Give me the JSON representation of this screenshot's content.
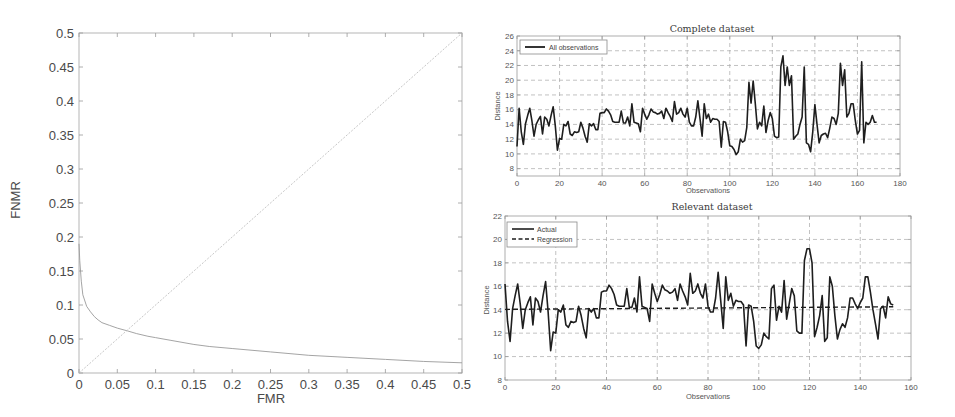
{
  "chart_data": [
    {
      "type": "line",
      "title": "",
      "xlabel": "FMR",
      "ylabel": "FNMR",
      "xlim": [
        0,
        0.5
      ],
      "ylim": [
        0,
        0.5
      ],
      "xticks": [
        0,
        0.05,
        0.1,
        0.15,
        0.2,
        0.25,
        0.3,
        0.35,
        0.4,
        0.45,
        0.5
      ],
      "xtick_labels": [
        "0",
        "0.05",
        "0.1",
        "0.15",
        "0.2",
        "0.25",
        "0.3",
        "0.35",
        "0.4",
        "0.45",
        "0.5"
      ],
      "yticks": [
        0,
        0.05,
        0.1,
        0.15,
        0.2,
        0.25,
        0.3,
        0.35,
        0.4,
        0.45,
        0.5
      ],
      "ytick_labels": [
        "0",
        "0.05",
        "0.1",
        "0.15",
        "0.2",
        "0.25",
        "0.3",
        "0.35",
        "0.4",
        "0.45",
        "0.5"
      ],
      "grid": false,
      "legend": null,
      "series": [
        {
          "name": "FNMR vs FMR",
          "color": "#9a9a9a",
          "width": 0.9,
          "x": [
            0,
            0.001,
            0.003,
            0.005,
            0.01,
            0.015,
            0.02,
            0.025,
            0.03,
            0.04,
            0.05,
            0.063,
            0.075,
            0.09,
            0.1,
            0.12,
            0.15,
            0.17,
            0.2,
            0.25,
            0.3,
            0.35,
            0.4,
            0.45,
            0.5
          ],
          "y": [
            0.19,
            0.165,
            0.135,
            0.115,
            0.098,
            0.09,
            0.083,
            0.078,
            0.074,
            0.07,
            0.066,
            0.062,
            0.058,
            0.054,
            0.052,
            0.048,
            0.042,
            0.039,
            0.036,
            0.031,
            0.026,
            0.023,
            0.02,
            0.017,
            0.015
          ]
        },
        {
          "name": "EER line",
          "color": "#b8b8b8",
          "width": 0.8,
          "dash": "2 1.5",
          "x": [
            0,
            0.5
          ],
          "y": [
            0,
            0.5
          ]
        }
      ]
    },
    {
      "type": "line",
      "title": "Complete dataset",
      "xlabel": "Observations",
      "ylabel": "Distance",
      "xlim": [
        0,
        180
      ],
      "ylim": [
        7,
        26
      ],
      "xticks": [
        0,
        20,
        40,
        60,
        80,
        100,
        120,
        140,
        160,
        180
      ],
      "xtick_labels": [
        "0",
        "20",
        "40",
        "60",
        "80",
        "100",
        "120",
        "140",
        "160",
        "180"
      ],
      "yticks": [
        8,
        10,
        12,
        14,
        16,
        18,
        20,
        22,
        24,
        26
      ],
      "ytick_labels": [
        "8",
        "10",
        "12",
        "14",
        "16",
        "18",
        "20",
        "22",
        "24",
        "26"
      ],
      "grid": true,
      "legend": {
        "position": "upper left",
        "entries": [
          "All observations"
        ]
      },
      "series": [
        {
          "name": "All observations",
          "color": "#1e1e1e",
          "width": 1.6,
          "values": [
            11.0,
            16.2,
            13.0,
            11.3,
            14.1,
            15.2,
            16.2,
            14.5,
            12.4,
            14.0,
            14.6,
            15.1,
            12.7,
            15.0,
            14.7,
            13.8,
            15.2,
            16.4,
            13.8,
            10.5,
            12.1,
            12.0,
            14.0,
            13.8,
            14.4,
            12.7,
            12.5,
            13.0,
            12.9,
            13.0,
            14.3,
            13.5,
            12.4,
            11.6,
            14.1,
            13.8,
            14.1,
            13.3,
            13.3,
            15.5,
            15.6,
            15.6,
            16.1,
            15.8,
            15.3,
            14.4,
            14.3,
            14.3,
            14.3,
            15.8,
            14.2,
            14.2,
            15.0,
            13.8,
            16.8,
            14.3,
            14.2,
            14.1,
            13.0,
            16.2,
            15.4,
            14.7,
            15.3,
            16.1,
            15.7,
            15.6,
            15.4,
            15.5,
            15.8,
            14.8,
            16.2,
            15.6,
            15.1,
            14.4,
            17.1,
            15.4,
            15.6,
            16.2,
            15.4,
            15.0,
            16.2,
            14.3,
            13.8,
            13.8,
            15.0,
            17.2,
            14.8,
            12.4,
            16.8,
            14.8,
            15.4,
            14.3,
            14.8,
            14.7,
            14.7,
            14.4,
            10.9,
            14.4,
            14.3,
            13.0,
            11.1,
            11.0,
            10.6,
            9.9,
            10.3,
            12.0,
            11.6,
            11.8,
            13.6,
            19.7,
            16.9,
            19.9,
            16.8,
            13.4,
            14.3,
            13.8,
            16.5,
            12.9,
            14.5,
            15.6,
            14.8,
            12.4,
            12.2,
            12.3,
            21.8,
            23.3,
            19.3,
            21.8,
            19.3,
            20.6,
            12.0,
            12.4,
            12.7,
            14.0,
            15.0,
            21.8,
            11.5,
            11.3,
            10.3,
            13.0,
            16.7,
            14.0,
            11.5,
            12.5,
            12.7,
            12.8,
            12.2,
            13.5,
            15.0,
            14.8,
            14.0,
            15.5,
            22.3,
            19.3,
            21.4,
            15.0,
            15.5,
            16.8,
            16.8,
            14.5,
            12.7,
            13.2,
            22.5,
            11.5,
            14.3,
            14.0,
            14.3,
            15.2,
            14.3,
            14.3
          ]
        }
      ]
    },
    {
      "type": "line",
      "title": "Relevant dataset",
      "xlabel": "Observations",
      "ylabel": "Distance",
      "xlim": [
        0,
        160
      ],
      "ylim": [
        8,
        22
      ],
      "xticks": [
        0,
        20,
        40,
        60,
        80,
        100,
        120,
        140,
        160
      ],
      "xtick_labels": [
        "0",
        "20",
        "40",
        "60",
        "80",
        "100",
        "120",
        "140",
        "160"
      ],
      "yticks": [
        8,
        10,
        12,
        14,
        16,
        18,
        20,
        22
      ],
      "ytick_labels": [
        "8",
        "10",
        "12",
        "14",
        "16",
        "18",
        "20",
        "22"
      ],
      "grid": true,
      "legend": {
        "position": "upper left",
        "entries": [
          "Actual",
          "Regression"
        ]
      },
      "series": [
        {
          "name": "Actual",
          "color": "#1e1e1e",
          "width": 1.6,
          "values": [
            16.2,
            13.0,
            11.3,
            14.1,
            15.2,
            16.2,
            14.5,
            12.4,
            14.0,
            14.6,
            15.1,
            12.7,
            15.0,
            14.7,
            13.8,
            15.2,
            16.4,
            13.8,
            10.5,
            12.1,
            12.0,
            14.0,
            13.8,
            14.4,
            12.7,
            12.5,
            13.0,
            12.9,
            13.0,
            14.3,
            13.5,
            12.4,
            11.6,
            14.1,
            13.8,
            14.1,
            13.3,
            13.3,
            15.5,
            15.6,
            15.6,
            16.1,
            15.8,
            15.3,
            14.4,
            14.3,
            14.3,
            14.3,
            15.8,
            14.2,
            14.2,
            15.0,
            13.8,
            16.8,
            14.3,
            14.2,
            14.1,
            13.0,
            16.2,
            15.4,
            14.7,
            15.3,
            16.1,
            15.7,
            15.6,
            15.4,
            15.5,
            15.8,
            14.8,
            16.2,
            15.6,
            15.1,
            14.4,
            17.1,
            15.4,
            15.6,
            16.2,
            15.4,
            15.0,
            16.2,
            14.3,
            13.8,
            13.8,
            15.0,
            17.2,
            14.8,
            12.4,
            16.8,
            14.8,
            15.4,
            14.3,
            14.8,
            14.7,
            14.7,
            14.4,
            10.9,
            14.4,
            14.3,
            13.0,
            10.9,
            10.7,
            11.0,
            12.0,
            11.7,
            11.5,
            15.8,
            16.1,
            13.1,
            14.3,
            13.8,
            16.5,
            13.2,
            14.5,
            15.8,
            15.2,
            12.2,
            12.0,
            12.0,
            18.2,
            19.2,
            19.2,
            18.0,
            11.7,
            12.5,
            13.5,
            15.2,
            11.3,
            11.6,
            16.8,
            16.0,
            13.5,
            11.5,
            12.3,
            12.8,
            12.5,
            13.3,
            15.0,
            15.0,
            14.5,
            14.1,
            14.6,
            15.0,
            16.8,
            16.8,
            15.5,
            14.0,
            12.8,
            11.5,
            14.1,
            14.3,
            13.3,
            15.1,
            14.5,
            14.4
          ]
        },
        {
          "name": "Regression",
          "color": "#1e1e1e",
          "width": 1.4,
          "dash": "5 3",
          "x": [
            0,
            153
          ],
          "y": [
            14.03,
            14.25
          ]
        }
      ]
    }
  ]
}
